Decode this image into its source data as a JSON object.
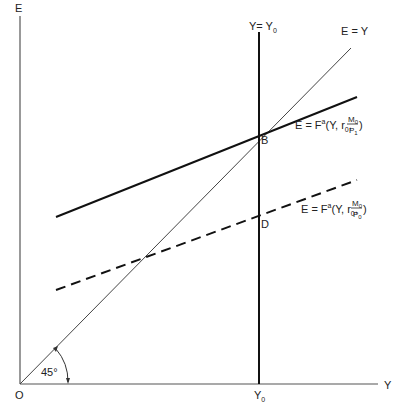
{
  "axes": {
    "y_label": "E",
    "x_label": "Y",
    "origin_label": "O",
    "x_tick_label": "Y",
    "x_tick_sub": "0"
  },
  "lines": {
    "vertical": {
      "label": "Y= Y",
      "label_sub": "0"
    },
    "forty_five": {
      "label": "E = Y",
      "angle_label": "45°"
    },
    "solid": {
      "label_main": "E = F",
      "label_sup": "a",
      "label_args": "(Y, r",
      "label_args_sub": "0",
      "frac_num": "M",
      "frac_num_sub": "0",
      "frac_den": "P",
      "frac_den_sub": "1",
      "close": ")"
    },
    "dashed": {
      "label_main": "E = F",
      "label_sup": "a",
      "label_args": "(Y, r",
      "label_args_sub": "0",
      "frac_num": "M",
      "frac_num_sub": "0",
      "frac_den": "P",
      "frac_den_sub": "0",
      "close": ")"
    }
  },
  "points": {
    "B": "B",
    "D": "D"
  }
}
